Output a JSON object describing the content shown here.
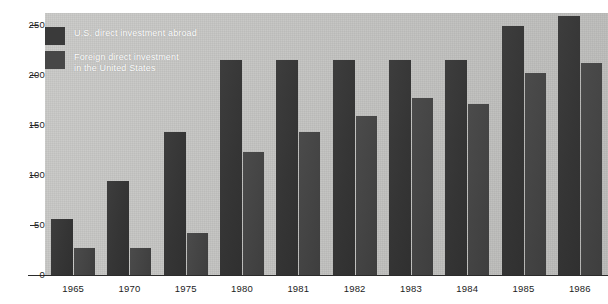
{
  "chart_data": {
    "type": "bar",
    "title": "",
    "subtitle": "",
    "xlabel": "",
    "ylabel": "",
    "categories": [
      "1965",
      "1970",
      "1975",
      "1980",
      "1981",
      "1982",
      "1983",
      "1984",
      "1985",
      "1986"
    ],
    "series": [
      {
        "name": "U.S. direct investment abroad",
        "color": "#3a3a3a",
        "values": [
          56,
          94,
          143,
          215,
          215,
          215,
          215,
          215,
          249,
          259
        ]
      },
      {
        "name": "Foreign direct investment in the United States",
        "color": "#474747",
        "values": [
          27,
          27,
          42,
          123,
          143,
          159,
          177,
          171,
          202,
          212
        ]
      }
    ],
    "ylim": [
      0,
      262
    ],
    "yticks": [
      0,
      50,
      100,
      150,
      200,
      250
    ],
    "ytick_labels": [
      "0",
      "50",
      "100",
      "150",
      "200",
      "250"
    ],
    "grid": false,
    "legend_position": "top-left",
    "plot_background": "#c3c3c1"
  },
  "legend": {
    "items": [
      {
        "label_line1": "U.S. direct investment abroad",
        "label_line2": ""
      },
      {
        "label_line1": "Foreign direct investment",
        "label_line2": "in the United States"
      }
    ]
  },
  "axis": {
    "y_labels": [
      "250",
      "200",
      "150",
      "100",
      "50",
      "0"
    ],
    "x_labels": [
      "1965",
      "1970",
      "1975",
      "1980",
      "1981",
      "1982",
      "1983",
      "1984",
      "1985",
      "1986"
    ]
  }
}
